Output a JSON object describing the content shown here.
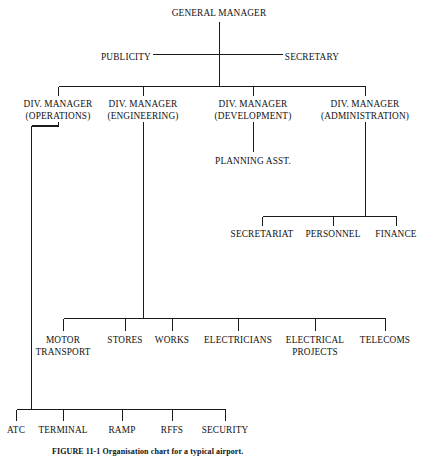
{
  "figure": {
    "caption": "FIGURE 11-1   Organisation chart for a typical airport."
  },
  "chart_data": {
    "type": "diagram",
    "diagram_type": "organisation-chart",
    "title": "GENERAL MANAGER",
    "nodes": [
      {
        "id": "general-manager",
        "label": "GENERAL MANAGER",
        "sublabel": "",
        "x": 219,
        "y": 8,
        "level": 0
      },
      {
        "id": "publicity",
        "label": "PUBLICITY",
        "sublabel": "",
        "x": 126,
        "y": 52,
        "level": 1
      },
      {
        "id": "secretary",
        "label": "SECRETARY",
        "sublabel": "",
        "x": 312,
        "y": 52,
        "level": 1
      },
      {
        "id": "div-manager-operations",
        "label": "DIV. MANAGER",
        "sublabel": "(OPERATIONS)",
        "x": 58,
        "y": 99,
        "level": 2
      },
      {
        "id": "div-manager-engineering",
        "label": "DIV. MANAGER",
        "sublabel": "(ENGINEERING)",
        "x": 143,
        "y": 99,
        "level": 2
      },
      {
        "id": "div-manager-development",
        "label": "DIV. MANAGER",
        "sublabel": "(DEVELOPMENT)",
        "x": 253,
        "y": 99,
        "level": 2
      },
      {
        "id": "div-manager-administration",
        "label": "DIV. MANAGER",
        "sublabel": "(ADMINISTRATION)",
        "x": 365,
        "y": 99,
        "level": 2
      },
      {
        "id": "planning-asst",
        "label": "PLANNING ASST.",
        "sublabel": "",
        "x": 253,
        "y": 156,
        "level": 3
      },
      {
        "id": "secretariat",
        "label": "SECRETARIAT",
        "sublabel": "",
        "x": 262,
        "y": 229,
        "level": 3
      },
      {
        "id": "personnel",
        "label": "PERSONNEL",
        "sublabel": "",
        "x": 333,
        "y": 229,
        "level": 3
      },
      {
        "id": "finance",
        "label": "FINANCE",
        "sublabel": "",
        "x": 396,
        "y": 229,
        "level": 3
      },
      {
        "id": "motor-transport",
        "label": "MOTOR",
        "sublabel": "TRANSPORT",
        "x": 63,
        "y": 335,
        "level": 3
      },
      {
        "id": "stores",
        "label": "STORES",
        "sublabel": "",
        "x": 125,
        "y": 335,
        "level": 3
      },
      {
        "id": "works",
        "label": "WORKS",
        "sublabel": "",
        "x": 172,
        "y": 335,
        "level": 3
      },
      {
        "id": "electricians",
        "label": "ELECTRICIANS",
        "sublabel": "",
        "x": 238,
        "y": 335,
        "level": 3
      },
      {
        "id": "electrical-projects",
        "label": "ELECTRICAL",
        "sublabel": "PROJECTS",
        "x": 315,
        "y": 335,
        "level": 3
      },
      {
        "id": "telecoms",
        "label": "TELECOMS",
        "sublabel": "",
        "x": 385,
        "y": 335,
        "level": 3
      },
      {
        "id": "atc",
        "label": "ATC",
        "sublabel": "",
        "x": 16,
        "y": 425,
        "level": 3
      },
      {
        "id": "terminal",
        "label": "TERMINAL",
        "sublabel": "",
        "x": 63,
        "y": 425,
        "level": 3
      },
      {
        "id": "ramp",
        "label": "RAMP",
        "sublabel": "",
        "x": 122,
        "y": 425,
        "level": 3
      },
      {
        "id": "rffs",
        "label": "RFFS",
        "sublabel": "",
        "x": 172,
        "y": 425,
        "level": 3
      },
      {
        "id": "security",
        "label": "SECURITY",
        "sublabel": "",
        "x": 225,
        "y": 425,
        "level": 3
      }
    ],
    "edges": [
      {
        "from": "general-manager",
        "to": "publicity"
      },
      {
        "from": "general-manager",
        "to": "secretary"
      },
      {
        "from": "general-manager",
        "to": "div-manager-operations"
      },
      {
        "from": "general-manager",
        "to": "div-manager-engineering"
      },
      {
        "from": "general-manager",
        "to": "div-manager-development"
      },
      {
        "from": "general-manager",
        "to": "div-manager-administration"
      },
      {
        "from": "div-manager-development",
        "to": "planning-asst"
      },
      {
        "from": "div-manager-administration",
        "to": "secretariat"
      },
      {
        "from": "div-manager-administration",
        "to": "personnel"
      },
      {
        "from": "div-manager-administration",
        "to": "finance"
      },
      {
        "from": "div-manager-engineering",
        "to": "motor-transport"
      },
      {
        "from": "div-manager-engineering",
        "to": "stores"
      },
      {
        "from": "div-manager-engineering",
        "to": "works"
      },
      {
        "from": "div-manager-engineering",
        "to": "electricians"
      },
      {
        "from": "div-manager-engineering",
        "to": "electrical-projects"
      },
      {
        "from": "div-manager-engineering",
        "to": "telecoms"
      },
      {
        "from": "div-manager-operations",
        "to": "atc"
      },
      {
        "from": "div-manager-operations",
        "to": "terminal"
      },
      {
        "from": "div-manager-operations",
        "to": "ramp"
      },
      {
        "from": "div-manager-operations",
        "to": "rffs"
      },
      {
        "from": "div-manager-operations",
        "to": "security"
      }
    ],
    "line_color": "#1a1a1a",
    "background": "#ffffff"
  }
}
